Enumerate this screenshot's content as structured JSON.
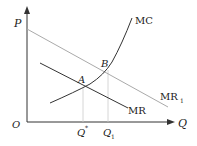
{
  "diagram": {
    "type": "economics-cost-revenue",
    "axes": {
      "y_label": "P",
      "x_label": "Q",
      "origin_label": "O"
    },
    "curves": [
      {
        "name": "MC",
        "label": "MC",
        "color": "#333333"
      },
      {
        "name": "MR",
        "label": "MR",
        "color": "#333333"
      },
      {
        "name": "MR1",
        "label": "MR",
        "subscript": "1",
        "color": "#aaaaaa"
      }
    ],
    "points": [
      {
        "name": "A",
        "label": "A"
      },
      {
        "name": "B",
        "label": "B"
      }
    ],
    "x_ticks": [
      {
        "label": "Q",
        "superscript": "*"
      },
      {
        "label": "Q",
        "subscript": "1"
      }
    ],
    "colors": {
      "axis": "#333333",
      "guide": "#cccccc"
    }
  }
}
